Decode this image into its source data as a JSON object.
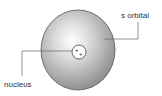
{
  "diagram": {
    "title": "",
    "labels": {
      "orbital": "s orbital",
      "nucleus": "nucleus"
    },
    "nucleus_symbols": [
      "+",
      "+"
    ],
    "colors": {
      "sphere_light": "#f4f4f4",
      "sphere_dark": "#8a8a8a",
      "outline": "#555555",
      "line": "#666666"
    }
  }
}
